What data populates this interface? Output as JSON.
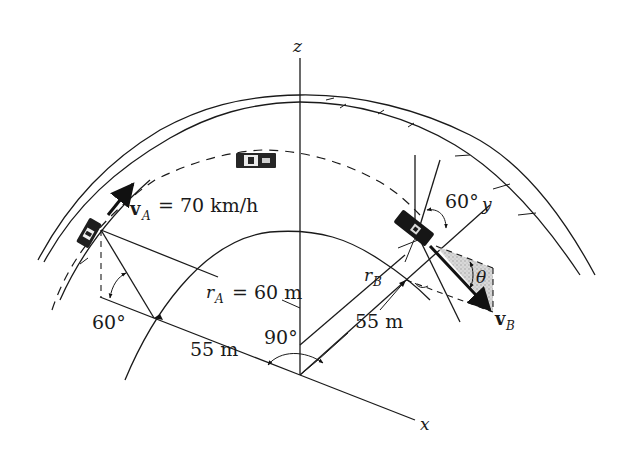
{
  "figure": {
    "type": "kinematics-diagram"
  },
  "axes": {
    "z_label": "z",
    "x_label": "x",
    "y_label": "y"
  },
  "car_a": {
    "velocity_symbol": "v",
    "velocity_subscript": "A",
    "velocity_equals": "= 70 km/h",
    "radius_symbol": "r",
    "radius_subscript": "A",
    "radius_equals": "= 60 m",
    "elevation_angle": "60°",
    "horizontal_distance": "55 m"
  },
  "car_b": {
    "velocity_symbol": "v",
    "velocity_subscript": "B",
    "radius_symbol": "r",
    "radius_subscript": "B",
    "horizontal_distance": "55 m",
    "elevation_angle": "60°",
    "pitch_angle": "θ"
  },
  "angles": {
    "between_radials": "90°"
  },
  "colors": {
    "ink": "#1a1a1a",
    "shade": "#c8c8c8",
    "background": "#ffffff"
  }
}
